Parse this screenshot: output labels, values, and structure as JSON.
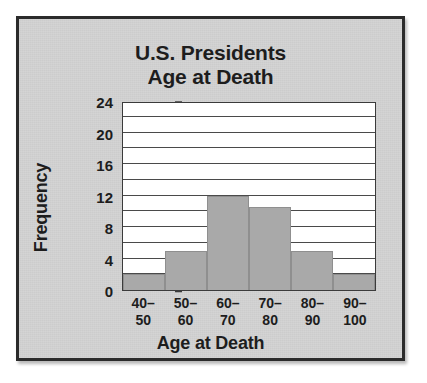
{
  "chart_data": {
    "type": "bar",
    "title": "U.S. Presidents Age at Death",
    "title_line1": "U.S. Presidents",
    "title_line2": "Age at Death",
    "xlabel": "Age at Death",
    "ylabel": "Frequency",
    "categories": [
      "40–50",
      "50–60",
      "60–70",
      "70–80",
      "80–90",
      "90–100"
    ],
    "category_lines": [
      {
        "top": "40–",
        "bottom": "50"
      },
      {
        "top": "50–",
        "bottom": "60"
      },
      {
        "top": "60–",
        "bottom": "70"
      },
      {
        "top": "70–",
        "bottom": "80"
      },
      {
        "top": "80–",
        "bottom": "90"
      },
      {
        "top": "90–",
        "bottom": "100"
      }
    ],
    "values": [
      2,
      5,
      12,
      10.5,
      5,
      2
    ],
    "ylim": [
      0,
      24
    ],
    "ytick_labels": [
      "0",
      "4",
      "8",
      "12",
      "16",
      "20",
      "24"
    ],
    "ytick_values": [
      0,
      4,
      8,
      12,
      16,
      20,
      24
    ],
    "gridline_values": [
      2,
      4,
      6,
      8,
      10,
      12,
      14,
      16,
      18,
      20,
      22
    ],
    "grid": true,
    "legend": false,
    "colors": {
      "bar_fill": "#a9a9a9",
      "bar_edge": "#8f8f8f",
      "plot_background": "#ffffff",
      "card_background": "#d2d2d2",
      "frame": "#2b2b2b",
      "text": "#1d1d1d",
      "gridline": "#4a4a4a"
    }
  }
}
